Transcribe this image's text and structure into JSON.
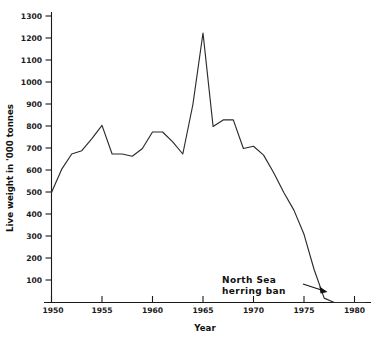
{
  "chart_data": {
    "type": "line",
    "title": "",
    "subtitle": "",
    "xlabel": "Year",
    "ylabel": "Live weight in '000 tonnes",
    "xlim": [
      1950,
      1981.5
    ],
    "ylim": [
      0,
      1350
    ],
    "grid": false,
    "legend": null,
    "xticks": [
      1950,
      1955,
      1960,
      1965,
      1970,
      1975,
      1980
    ],
    "xtick_labels": [
      "1950",
      "1955",
      "1960",
      "1965",
      "1970",
      "1975",
      "1980"
    ],
    "yticks": [
      100,
      200,
      300,
      400,
      500,
      600,
      700,
      800,
      900,
      1000,
      1100,
      1200,
      1300
    ],
    "ytick_labels": [
      "100",
      "200",
      "300",
      "400",
      "500",
      "600",
      "700",
      "800",
      "900",
      "1000",
      "1100",
      "1200",
      "1300"
    ],
    "series": [
      {
        "name": "North Sea herring landings",
        "x": [
          1950,
          1951,
          1952,
          1953,
          1954,
          1955,
          1956,
          1957,
          1958,
          1959,
          1960,
          1961,
          1962,
          1963,
          1964,
          1965,
          1966,
          1967,
          1968,
          1969,
          1970,
          1971,
          1972,
          1973,
          1974,
          1975,
          1976,
          1977,
          1978,
          1979,
          1980,
          1981
        ],
        "values": [
          500,
          605,
          675,
          690,
          745,
          805,
          675,
          675,
          665,
          700,
          775,
          775,
          730,
          675,
          900,
          1225,
          800,
          830,
          830,
          700,
          710,
          670,
          590,
          500,
          420,
          310,
          150,
          20,
          0,
          0,
          0,
          0
        ]
      }
    ],
    "annotations": [
      {
        "name": "herring-ban-annotation",
        "line1": "North  Sea",
        "line2": "herring  ban",
        "arrow_from_year": 1975.6,
        "arrow_from_value": 150,
        "arrow_to_year": 1977.4,
        "arrow_to_value": 60
      }
    ]
  }
}
